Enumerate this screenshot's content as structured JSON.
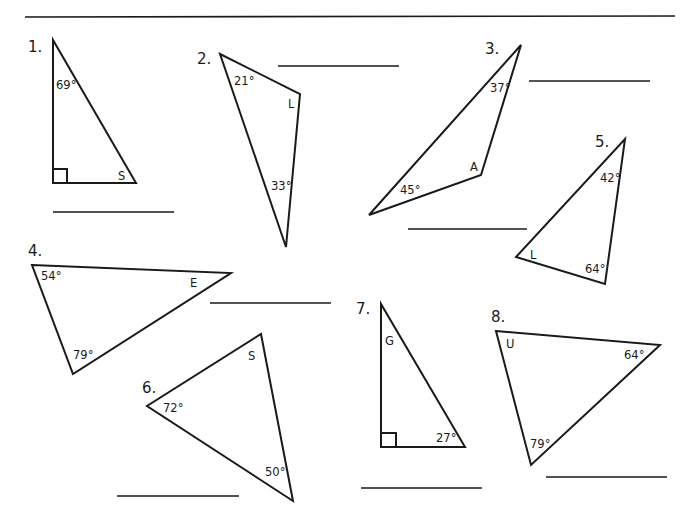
{
  "problems": [
    {
      "number": "1.",
      "angles": [
        "69°",
        "S"
      ],
      "right_angle": true
    },
    {
      "number": "2.",
      "angles": [
        "21°",
        "L",
        "33°"
      ]
    },
    {
      "number": "3.",
      "angles": [
        "37°",
        "A",
        "45°"
      ]
    },
    {
      "number": "4.",
      "angles": [
        "54°",
        "E",
        "79°"
      ]
    },
    {
      "number": "5.",
      "angles": [
        "42°",
        "L",
        "64°"
      ]
    },
    {
      "number": "6.",
      "angles": [
        "S",
        "72°",
        "50°"
      ]
    },
    {
      "number": "7.",
      "angles": [
        "G",
        "27°"
      ],
      "right_angle": true
    },
    {
      "number": "8.",
      "angles": [
        "U",
        "64°",
        "79°"
      ]
    }
  ]
}
